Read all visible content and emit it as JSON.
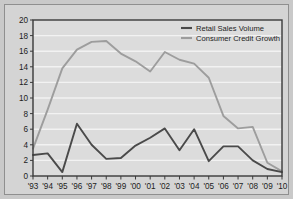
{
  "chart_data": {
    "type": "line",
    "title": "",
    "subtitle": "",
    "xlabel": "",
    "ylabel": "",
    "x": [
      "'93",
      "'94",
      "'95",
      "'96",
      "'97",
      "'98",
      "'99",
      "'00",
      "'01",
      "'02",
      "'03",
      "'04",
      "'05",
      "'06",
      "'07",
      "'08",
      "'09",
      "'10"
    ],
    "categories": [
      "'93",
      "'94",
      "'95",
      "'96",
      "'97",
      "'98",
      "'99",
      "'00",
      "'01",
      "'02",
      "'03",
      "'04",
      "'05",
      "'06",
      "'07",
      "'08",
      "'09",
      "'10"
    ],
    "ylim": [
      0,
      20
    ],
    "yticks": [
      "0",
      "2",
      "4",
      "6",
      "8",
      "10",
      "12",
      "14",
      "16",
      "18",
      "20"
    ],
    "ytick_values": [
      0,
      2,
      4,
      6,
      8,
      10,
      12,
      14,
      16,
      18,
      20
    ],
    "grid": true,
    "grid_orientation": "horizontal",
    "legend_position": "top-right",
    "series": [
      {
        "name": "Retail Sales Volume",
        "color": "#4a4a4a",
        "values": [
          2.7,
          2.9,
          0.5,
          6.7,
          4.0,
          2.2,
          2.3,
          3.9,
          4.9,
          6.1,
          3.3,
          6.0,
          1.9,
          3.8,
          3.8,
          2.0,
          0.9,
          0.5
        ]
      },
      {
        "name": "Consumer Credit Growth",
        "color": "#9d9d9d",
        "values": [
          3.5,
          8.5,
          13.8,
          16.2,
          17.2,
          17.3,
          15.7,
          14.7,
          13.4,
          15.9,
          14.9,
          14.4,
          12.6,
          7.7,
          6.1,
          6.3,
          1.7,
          0.6
        ]
      }
    ]
  },
  "style": {
    "page_background": "#c9c9c9",
    "panel_background": "#d4d4d4",
    "plot_background": "#dcdcdc",
    "gridline_color": "#f2f2f2",
    "axis_color": "#3a3a3a",
    "text_color": "#1c1c1c"
  }
}
